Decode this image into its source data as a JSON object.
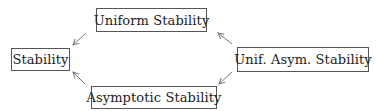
{
  "diagram": {
    "type": "implication-diagram",
    "nodes": [
      {
        "id": "stability",
        "label": "Stability"
      },
      {
        "id": "uniform",
        "label": "Uniform Stability"
      },
      {
        "id": "asymptotic",
        "label": "Asymptotic Stability"
      },
      {
        "id": "unif_asym",
        "label": "Unif. Asym. Stability"
      }
    ],
    "edges": [
      {
        "from": "uniform",
        "to": "stability"
      },
      {
        "from": "asymptotic",
        "to": "stability"
      },
      {
        "from": "unif_asym",
        "to": "uniform"
      },
      {
        "from": "unif_asym",
        "to": "asymptotic"
      }
    ],
    "colors": {
      "border": "#555555",
      "text": "#222222",
      "arrow": "#777777",
      "background": "#ffffff"
    }
  }
}
